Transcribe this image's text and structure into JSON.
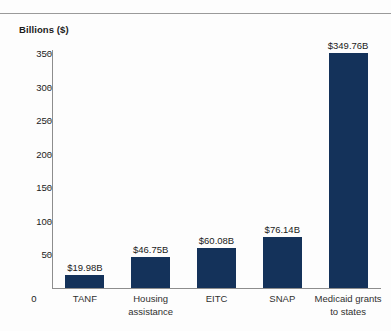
{
  "chart_data": {
    "type": "bar",
    "title": "",
    "ylabel": "Billions ($)",
    "xlabel": "",
    "categories": [
      "TANF",
      "Housing assistance",
      "EITC",
      "SNAP",
      "Medicaid grants to states"
    ],
    "category_lines": [
      [
        "TANF"
      ],
      [
        "Housing",
        "assistance"
      ],
      [
        "EITC"
      ],
      [
        "SNAP"
      ],
      [
        "Medicaid grants",
        "to states"
      ]
    ],
    "values": [
      19.98,
      46.75,
      60.08,
      76.14,
      349.76
    ],
    "value_labels": [
      "$19.98B",
      "$46.75B",
      "$60.08B",
      "$76.14B",
      "$349.76B"
    ],
    "ylim": [
      0,
      350
    ],
    "yticks": [
      0,
      50,
      100,
      150,
      200,
      250,
      300,
      350
    ],
    "ytick_labels": [
      "0",
      "50",
      "100",
      "150",
      "200",
      "250",
      "300",
      "350"
    ],
    "grid": false,
    "legend": "none",
    "bar_color": "#14325a",
    "axis_color": "#8d8d8d",
    "text_color": "#1b1b1b"
  },
  "axis": {
    "y_title": "Billions ($)",
    "zero_label": "0"
  }
}
